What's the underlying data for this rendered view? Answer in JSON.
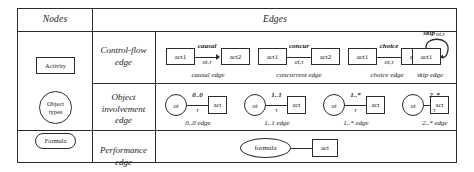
{
  "table": {
    "headers": {
      "nodes": "Nodes",
      "edges": "Edges"
    },
    "row_labels": {
      "control_flow": "Control-flow edge",
      "control_flow_line1": "Control-flow",
      "control_flow_line2": "edge",
      "object_involvement_line1": "Object",
      "object_involvement_line2": "involvement",
      "object_involvement_line3": "edge",
      "performance_line1": "Performance",
      "performance_line2": "edge"
    }
  },
  "nodes": [
    {
      "name": "activity",
      "label": "Activity",
      "shape": "rectangle"
    },
    {
      "name": "object-types",
      "label_line1": "Object",
      "label_line2": "types",
      "shape": "circle"
    },
    {
      "name": "formula",
      "label": "Formula",
      "shape": "rounded-rectangle"
    }
  ],
  "control_flow_edges": [
    {
      "id": "causal",
      "source": "act1",
      "target": "act2",
      "top_label": "causal",
      "bottom_label": "ot,τ",
      "caption": "causal edge",
      "arrow": true
    },
    {
      "id": "concurrent",
      "source": "act1",
      "target": "act2",
      "top_label": "concur",
      "bottom_label": "ot,τ",
      "caption": "concurrent edge",
      "arrow": false
    },
    {
      "id": "choice",
      "source": "act1",
      "target": "act2",
      "top_label": "choice",
      "bottom_label": "ot,τ",
      "caption": "choice edge",
      "arrow": false
    },
    {
      "id": "skip",
      "source": "act1",
      "target": "act1",
      "top_label": "skip",
      "bottom_label": "ot,τ",
      "caption": "skip edge",
      "arrow": true,
      "self_loop": true
    }
  ],
  "object_involvement_edges": [
    {
      "id": "zero-zero",
      "source": "ot",
      "target": "act",
      "top_label": "0..0",
      "bottom_label": "τ",
      "caption": "0..0 edge"
    },
    {
      "id": "one-one",
      "source": "ot",
      "target": "act",
      "top_label": "1..1",
      "bottom_label": "τ",
      "caption": "1..1 edge"
    },
    {
      "id": "one-star",
      "source": "ot",
      "target": "act",
      "top_label": "1..*",
      "bottom_label": "τ",
      "caption": "1..* edge"
    },
    {
      "id": "two-star",
      "source": "ot",
      "target": "act",
      "top_label": "2..*",
      "bottom_label": "τ",
      "caption": "2..* edge"
    }
  ],
  "performance_edge": {
    "id": "performance",
    "source": "formula",
    "target": "act"
  },
  "colors": {
    "stroke": "#2b2b2b",
    "background": "#ffffff",
    "text": "#1a1a1a"
  }
}
